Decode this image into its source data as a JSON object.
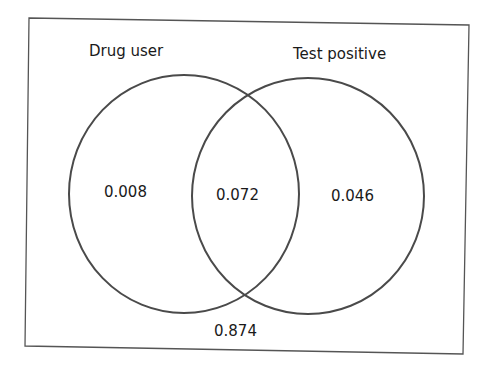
{
  "diagram": {
    "type": "venn",
    "sets": [
      {
        "label": "Drug user",
        "only_value": "0.008"
      },
      {
        "label": "Test positive",
        "only_value": "0.046"
      }
    ],
    "intersection_value": "0.072",
    "outside_value": "0.874",
    "colors": {
      "stroke": "#4a4a4a",
      "text": "#1a1a1a",
      "background": "#ffffff"
    }
  }
}
